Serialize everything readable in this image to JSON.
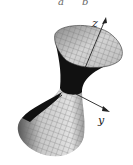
{
  "figure": {
    "top_cutoff_labels": [
      "a",
      "b"
    ],
    "axes": {
      "z_label": "z",
      "y_label": "y"
    },
    "colors": {
      "surface_light": "#d8d8d8",
      "surface_mid": "#9a9a9a",
      "surface_dark": "#111111",
      "mesh": "#6a6a6a",
      "axis": "#222222"
    }
  }
}
